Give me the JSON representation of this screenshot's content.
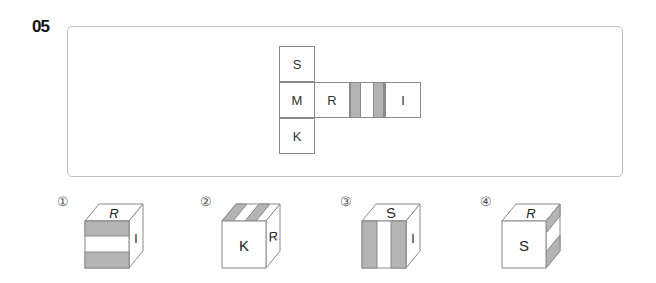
{
  "question": {
    "number": "05"
  },
  "net": {
    "cells": [
      {
        "id": "s",
        "label": "S"
      },
      {
        "id": "m",
        "label": "M"
      },
      {
        "id": "k",
        "label": "K"
      },
      {
        "id": "r",
        "label": "R"
      },
      {
        "id": "striped",
        "label": ""
      },
      {
        "id": "i",
        "label": "I"
      }
    ]
  },
  "options": [
    {
      "marker": "①",
      "top": "R",
      "front": "",
      "right": "I",
      "front_pattern": "horizontal-stripes"
    },
    {
      "marker": "②",
      "top": "",
      "front": "K",
      "right": "R",
      "top_pattern": "diagonal-stripes"
    },
    {
      "marker": "③",
      "top": "S",
      "front": "",
      "right": "I",
      "front_pattern": "vertical-stripes"
    },
    {
      "marker": "④",
      "top": "R",
      "front": "S",
      "right": "",
      "right_pattern": "stripes"
    }
  ],
  "colors": {
    "stripe": "#b4b4b4",
    "line": "#8a8a8a",
    "panel_border": "#bfbfbf"
  }
}
